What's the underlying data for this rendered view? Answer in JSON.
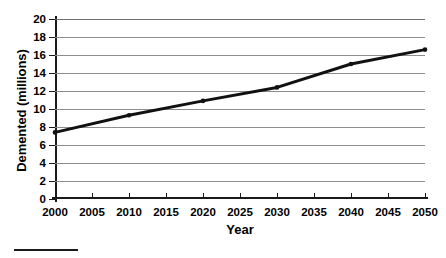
{
  "chart_data": {
    "type": "line",
    "title": "",
    "xlabel": "Year",
    "ylabel": "Demented (millions)",
    "xlim": [
      2000,
      2050
    ],
    "ylim": [
      0,
      20
    ],
    "grid": true,
    "legend": null,
    "x_ticks": [
      "2000",
      "2005",
      "2010",
      "2015",
      "2020",
      "2025",
      "2030",
      "2035",
      "2040",
      "2045",
      "2050"
    ],
    "y_ticks": [
      "0",
      "2",
      "4",
      "6",
      "8",
      "10",
      "12",
      "14",
      "16",
      "18",
      "20"
    ],
    "x": [
      2000,
      2010,
      2020,
      2030,
      2040,
      2050
    ],
    "series": [
      {
        "name": "Demented population",
        "values": [
          7.4,
          9.3,
          10.9,
          12.4,
          15.0,
          16.6
        ],
        "color": "#111111",
        "marker": "dot",
        "line_width": 3
      }
    ]
  },
  "figure": {
    "y_axis_title": "Demented (millions)",
    "x_axis_title": "Year"
  }
}
